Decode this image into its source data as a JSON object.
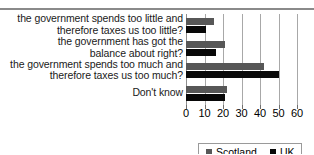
{
  "chart_data": {
    "type": "bar",
    "orientation": "horizontal",
    "title": "",
    "xlabel": "",
    "ylabel": "",
    "xlim": [
      0,
      60
    ],
    "grid": true,
    "legend_position": "bottom-right",
    "categories": [
      "the government spends too little and therefore taxes us too little?",
      "the government has got the balance about right?",
      "the government spends too much and therefore taxes us too much?",
      "Don't know"
    ],
    "tick_labels": [
      "0",
      "10",
      "20",
      "30",
      "40",
      "50",
      "60"
    ],
    "tick_values": [
      0,
      10,
      20,
      30,
      40,
      50,
      60
    ],
    "series": [
      {
        "name": "Scotland",
        "color": "#575757",
        "values": [
          15,
          21,
          42,
          22
        ]
      },
      {
        "name": "UK",
        "color": "#080808",
        "values": [
          11,
          16,
          50,
          21
        ]
      }
    ]
  },
  "categories_lines": [
    [
      "the government spends too little and",
      "therefore taxes us too little?"
    ],
    [
      "the government has got the",
      "balance about right?"
    ],
    [
      "the government spends too much and",
      "therefore taxes us too much?"
    ],
    [
      "Don't know"
    ]
  ],
  "legend": {
    "items": [
      {
        "label": "Scotland",
        "color": "#575757"
      },
      {
        "label": "UK",
        "color": "#080808"
      }
    ]
  }
}
